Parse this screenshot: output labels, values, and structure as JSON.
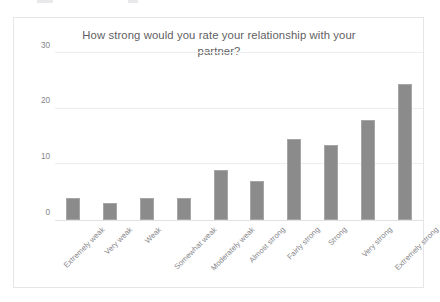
{
  "chart_data": {
    "type": "bar",
    "title": "How strong would you rate your relationship with your partner?",
    "title_line1": "How strong would you rate your relationship with your",
    "title_line2": "partner?",
    "xlabel": "",
    "ylabel": "",
    "ylim": [
      0,
      30
    ],
    "yticks": [
      0,
      10,
      20,
      30
    ],
    "ytick_labels": [
      "0",
      "10",
      "20",
      "30"
    ],
    "grid": true,
    "legend": false,
    "legend_position": "none",
    "bar_color": "#8b8b8b",
    "plot_background": "#ffffff",
    "categories": [
      "Extremely weak",
      "Very weak",
      "Weak",
      "Somewhat weak",
      "Moderately weak",
      "Almost strong",
      "Fairly strong",
      "Strong",
      "Very strong",
      "Extremely strong"
    ],
    "values": [
      4,
      3,
      4,
      4,
      9,
      7,
      14.5,
      13.5,
      18,
      24.5
    ]
  }
}
